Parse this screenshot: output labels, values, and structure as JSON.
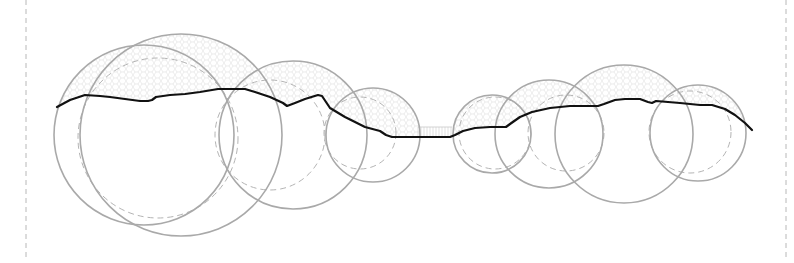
{
  "diagram": {
    "type": "terrain-section-with-overlapping-circles",
    "width": 794,
    "height": 263,
    "colors": {
      "background": "#ffffff",
      "circle_stroke": "#a9a9a9",
      "dashed_circle_stroke": "#b4b4b4",
      "border_dash": "#b8b8b8",
      "profile_line": "#111111",
      "texture": "#d8d8d8"
    },
    "borders": [
      {
        "x": 26,
        "y1": 0,
        "y2": 258
      },
      {
        "x": 786,
        "y1": 0,
        "y2": 258
      }
    ],
    "solid_circles": [
      {
        "id": "c1",
        "cx": 144,
        "cy": 135,
        "r": 90
      },
      {
        "id": "c2",
        "cx": 181,
        "cy": 135,
        "r": 101
      },
      {
        "id": "c3",
        "cx": 293,
        "cy": 135,
        "r": 74
      },
      {
        "id": "c4",
        "cx": 373,
        "cy": 135,
        "r": 47
      },
      {
        "id": "c5",
        "cx": 492,
        "cy": 134,
        "r": 39
      },
      {
        "id": "c6",
        "cx": 549,
        "cy": 134,
        "r": 54
      },
      {
        "id": "c7",
        "cx": 624,
        "cy": 134,
        "r": 69
      },
      {
        "id": "c8",
        "cx": 698,
        "cy": 133,
        "r": 48
      }
    ],
    "dashed_circles": [
      {
        "id": "d1",
        "cx": 158,
        "cy": 138,
        "r": 80
      },
      {
        "id": "d2",
        "cx": 270,
        "cy": 135,
        "r": 55
      },
      {
        "id": "d3",
        "cx": 360,
        "cy": 133,
        "r": 36
      },
      {
        "id": "d4",
        "cx": 495,
        "cy": 133,
        "r": 36
      },
      {
        "id": "d5",
        "cx": 566,
        "cy": 133,
        "r": 38
      },
      {
        "id": "d6",
        "cx": 690,
        "cy": 132,
        "r": 41
      }
    ],
    "profile_line": [
      [
        57,
        107
      ],
      [
        70,
        100
      ],
      [
        85,
        95
      ],
      [
        100,
        96
      ],
      [
        110,
        97
      ],
      [
        125,
        99
      ],
      [
        140,
        101
      ],
      [
        148,
        101
      ],
      [
        152,
        100
      ],
      [
        156,
        97
      ],
      [
        170,
        95
      ],
      [
        185,
        94
      ],
      [
        200,
        92
      ],
      [
        212,
        90
      ],
      [
        218,
        89
      ],
      [
        245,
        89
      ],
      [
        255,
        92
      ],
      [
        270,
        97
      ],
      [
        283,
        103
      ],
      [
        287,
        106
      ],
      [
        295,
        103
      ],
      [
        305,
        99
      ],
      [
        318,
        95
      ],
      [
        322,
        96
      ],
      [
        330,
        108
      ],
      [
        345,
        117
      ],
      [
        365,
        127
      ],
      [
        380,
        131
      ],
      [
        386,
        135
      ],
      [
        392,
        137
      ],
      [
        420,
        137
      ],
      [
        450,
        137
      ],
      [
        455,
        135
      ],
      [
        463,
        131
      ],
      [
        475,
        128
      ],
      [
        490,
        127
      ],
      [
        506,
        127
      ],
      [
        510,
        124
      ],
      [
        520,
        117
      ],
      [
        532,
        112
      ],
      [
        550,
        108
      ],
      [
        570,
        106
      ],
      [
        598,
        106
      ],
      [
        604,
        104
      ],
      [
        615,
        100
      ],
      [
        625,
        99
      ],
      [
        640,
        99
      ],
      [
        648,
        102
      ],
      [
        652,
        103
      ],
      [
        656,
        101
      ],
      [
        680,
        103
      ],
      [
        700,
        105
      ],
      [
        712,
        105
      ],
      [
        725,
        109
      ],
      [
        735,
        115
      ],
      [
        745,
        123
      ],
      [
        752,
        130
      ]
    ],
    "bridge": {
      "x1": 418,
      "x2": 452,
      "y_top": 127,
      "y_bottom": 137
    },
    "textured_regions_note": "faint mesh hatching above profile line within circles"
  }
}
